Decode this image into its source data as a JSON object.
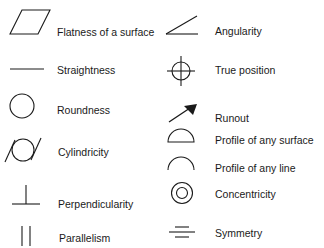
{
  "colors": {
    "ink": "#1a1a1a",
    "background": "#ffffff"
  },
  "left_column": [
    {
      "icon": "parallelogram-icon",
      "label": "Flatness of a surface"
    },
    {
      "icon": "horizontal-line-icon",
      "label": "Straightness"
    },
    {
      "icon": "circle-icon",
      "label": "Roundness"
    },
    {
      "icon": "circle-between-slanted-lines-icon",
      "label": "Cylindricity"
    },
    {
      "icon": "perpendicular-icon",
      "label": "Perpendicularity"
    },
    {
      "icon": "parallel-lines-icon",
      "label": "Parallelism"
    }
  ],
  "right_column": [
    {
      "icon": "angle-icon",
      "label": "Angularity"
    },
    {
      "icon": "crosshair-circle-icon",
      "label": "True position"
    },
    {
      "icon": "arrow-icon",
      "label": "Runout"
    },
    {
      "icon": "semicircle-closed-icon",
      "label": "Profile of any surface"
    },
    {
      "icon": "arc-icon",
      "label": "Profile of any line"
    },
    {
      "icon": "concentric-circles-icon",
      "label": "Concentricity"
    },
    {
      "icon": "three-lines-icon",
      "label": "Symmetry"
    }
  ]
}
